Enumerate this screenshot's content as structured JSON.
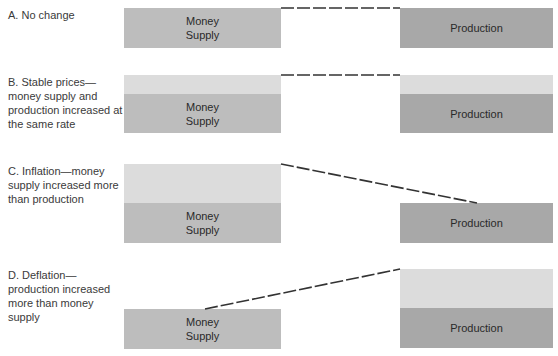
{
  "colors": {
    "money_supply": "#bdbdbd",
    "production": "#a8a8a8",
    "increase": "#dcdcdc",
    "dashed_line": "#333333"
  },
  "labels": {
    "money_supply": "Money\nSupply",
    "production": "Production"
  },
  "panels": [
    {
      "id": "A",
      "caption": "A. No change",
      "money_supply": {
        "base": "Money\nSupply",
        "increased": false
      },
      "production": {
        "base": "Production",
        "increased": false
      },
      "line": "level"
    },
    {
      "id": "B",
      "caption": "B. Stable prices—money supply and production increased at the same rate",
      "money_supply": {
        "base": "Money\nSupply",
        "increased": true
      },
      "production": {
        "base": "Production",
        "increased": true
      },
      "line": "level"
    },
    {
      "id": "C",
      "caption": "C. Inflation—money supply increased more than production",
      "money_supply": {
        "base": "Money\nSupply",
        "increased": true
      },
      "production": {
        "base": "Production",
        "increased": false
      },
      "line": "down"
    },
    {
      "id": "D",
      "caption": "D. Deflation—production increased more than money supply",
      "money_supply": {
        "base": "Money\nSupply",
        "increased": false
      },
      "production": {
        "base": "Production",
        "increased": true
      },
      "line": "up"
    }
  ]
}
